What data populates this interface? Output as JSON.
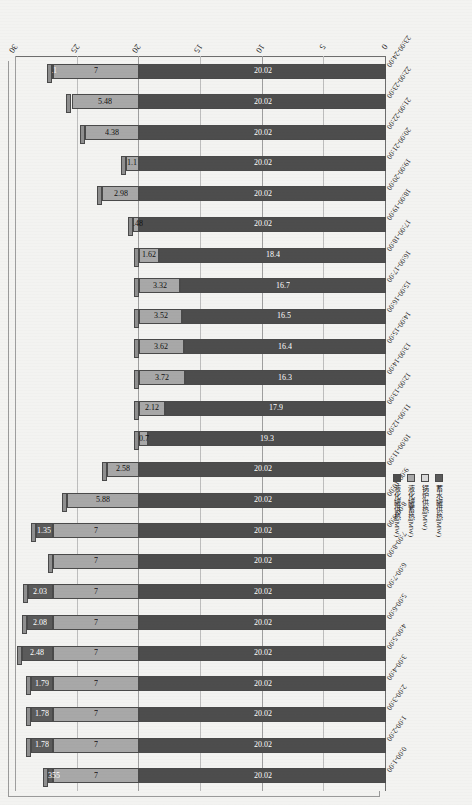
{
  "chart_data": {
    "type": "bar",
    "orientation": "horizontal",
    "stacked": true,
    "title": "",
    "xlabel": "",
    "ylabel": "",
    "xlim": [
      0,
      30
    ],
    "xticks": [
      0,
      5,
      10,
      15,
      20,
      25,
      30
    ],
    "grid": true,
    "legend_position": "left",
    "categories": [
      "0:00-1:00",
      "1:00-2:00",
      "2:00-3:00",
      "3:00-4:00",
      "4:00-5:00",
      "5:00-6:00",
      "6:00-7:00",
      "7:00-8:00",
      "8:00-9:00",
      "9:00-10:00",
      "10:00-11:00",
      "11:00-12:00",
      "12:00-13:00",
      "13:00-14:00",
      "14:00-15:00",
      "15:00-16:00",
      "16:00-17:00",
      "17:00-18:00",
      "18:00-19:00",
      "19:00-20:00",
      "20:00-21:00",
      "21:00-22:00",
      "22:00-23:00",
      "23:00-24:00"
    ],
    "series": [
      {
        "name": "液化罐供热(MW)",
        "color": "#4d4d4d",
        "values": [
          20.02,
          20.02,
          20.02,
          20.02,
          20.02,
          20.02,
          20.02,
          20.02,
          20.02,
          20.02,
          20.02,
          19.3,
          17.9,
          16.3,
          16.4,
          16.5,
          16.7,
          18.4,
          20.02,
          20.02,
          20.02,
          20.02,
          20.02,
          20.02
        ],
        "labels": [
          "20.02",
          "20.02",
          "20.02",
          "20.02",
          "20.02",
          "20.02",
          "20.02",
          "20.02",
          "20.02",
          "20.02",
          "20.02",
          "19.3",
          "17.9",
          "16.3",
          "16.4",
          "16.5",
          "16.7",
          "18.4",
          "20.02",
          "20.02",
          "20.02",
          "20.02",
          "20.02",
          "20.02"
        ]
      },
      {
        "name": "液化罐蓄热(MW)",
        "color": "#a8a8a8",
        "values": [
          7,
          7,
          7,
          7,
          7,
          7,
          7,
          7,
          7,
          5.88,
          2.58,
          0.7,
          2.12,
          3.72,
          3.62,
          3.52,
          3.32,
          1.62,
          0.48,
          2.98,
          1.1,
          4.38,
          5.48,
          7
        ],
        "labels": [
          "7",
          "7",
          "7",
          "7",
          "7",
          "7",
          "7",
          "7",
          "7",
          "5.88",
          "2.58",
          "0.7",
          "2.12",
          "3.72",
          "3.62",
          "3.52",
          "3.32",
          "1.62",
          "0.48",
          "2.98",
          "1.1",
          "4.38",
          "5.48",
          "7"
        ]
      },
      {
        "name": "锅炉供热(MW)",
        "color": "#d9d9d9",
        "values": [
          0,
          0,
          0,
          0,
          0,
          0,
          0,
          0,
          0,
          0,
          0,
          0,
          0,
          0,
          0,
          0,
          0,
          0,
          0,
          0,
          0,
          0,
          0,
          0
        ],
        "labels": [
          "",
          "",
          "",
          "",
          "",
          "",
          "",
          "",
          "",
          "",
          "",
          "",
          "",
          "",
          "",
          "",
          "",
          "",
          "",
          "",
          "",
          "",
          "",
          ""
        ]
      },
      {
        "name": "蓄水罐供热(MW)",
        "color": "#5b5b5b",
        "values": [
          0.355,
          1.78,
          1.78,
          1.79,
          2.48,
          2.08,
          2.03,
          0,
          1.35,
          0,
          0,
          0,
          0,
          0,
          0,
          0,
          0,
          0,
          0,
          0,
          0,
          0,
          0,
          0.1
        ],
        "labels": [
          "0.355",
          "1.78",
          "1.78",
          "1.79",
          "2.48",
          "2.08",
          "2.03",
          "0",
          "1.35",
          "",
          "",
          "",
          "",
          "",
          "",
          "",
          "",
          "",
          "",
          "",
          "",
          "",
          "",
          "0.1"
        ]
      }
    ]
  },
  "axis": {
    "value_tick_labels": [
      "0",
      "5",
      "10",
      "15",
      "20",
      "25",
      "30"
    ]
  },
  "legend": {
    "items": [
      {
        "label": "蓄水罐供热(MW)",
        "color": "#5b5b5b"
      },
      {
        "label": "锅炉供热(MW)",
        "color": "#d9d9d9"
      },
      {
        "label": "液化罐蓄热(MW)",
        "color": "#a8a8a8"
      },
      {
        "label": "液化罐供热(MW)",
        "color": "#4d4d4d"
      }
    ]
  }
}
